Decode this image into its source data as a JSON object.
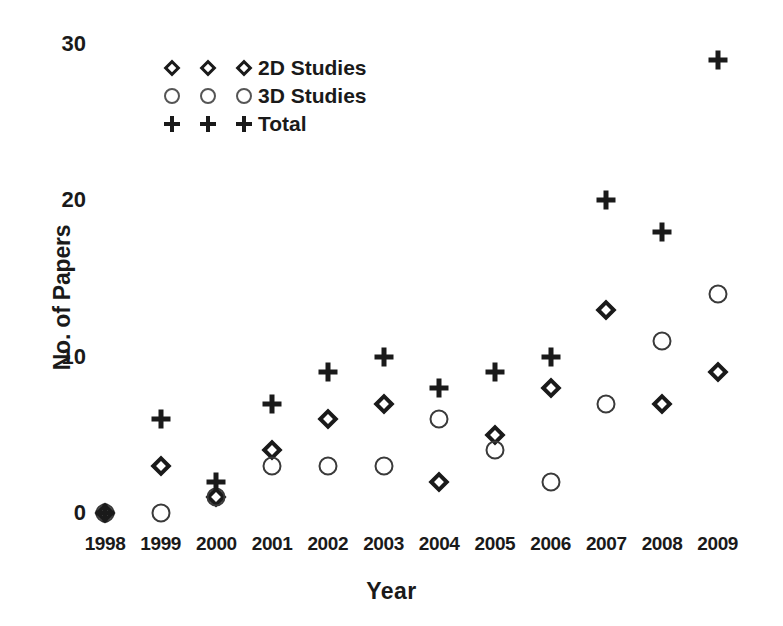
{
  "chart_data": {
    "type": "scatter",
    "title": "",
    "xlabel": "Year",
    "ylabel": "No. of Papers",
    "categories": [
      "1998",
      "1999",
      "2000",
      "2001",
      "2002",
      "2003",
      "2004",
      "2005",
      "2006",
      "2007",
      "2008",
      "2009"
    ],
    "ylim": [
      0,
      30
    ],
    "yticks": [
      "0",
      "10",
      "20",
      "30"
    ],
    "ytick_values": [
      0,
      10,
      20,
      30
    ],
    "grid": false,
    "legend_position": "top-left-inside",
    "series": [
      {
        "name": "2D Studies",
        "marker": "diamond",
        "color": "#1a1a1a",
        "values": [
          0,
          3,
          1,
          4,
          6,
          7,
          2,
          5,
          8,
          13,
          7,
          9
        ]
      },
      {
        "name": "3D Studies",
        "marker": "circle",
        "color": "#3a3a3a",
        "values": [
          0,
          0,
          1,
          3,
          3,
          3,
          6,
          4,
          2,
          7,
          11,
          14
        ]
      },
      {
        "name": "Total",
        "marker": "plus",
        "color": "#1a1a1a",
        "values": [
          0,
          6,
          2,
          7,
          9,
          10,
          8,
          9,
          10,
          20,
          18,
          29
        ]
      }
    ]
  },
  "legend": {
    "entries": [
      {
        "label": "2D Studies",
        "marker": "diamond"
      },
      {
        "label": "3D Studies",
        "marker": "circle"
      },
      {
        "label": "Total",
        "marker": "plus"
      }
    ]
  }
}
